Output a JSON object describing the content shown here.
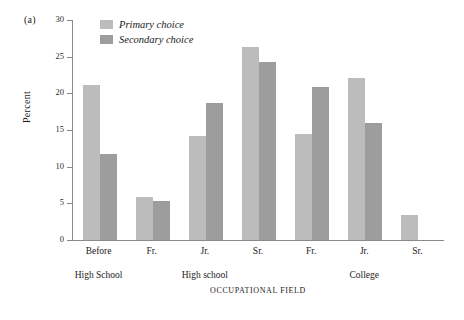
{
  "panel": {
    "label": "(a)"
  },
  "legend": {
    "position": "top-left-inside",
    "entries": [
      {
        "label": "Primary choice",
        "color": "#bcbcbc"
      },
      {
        "label": "Secondary choice",
        "color": "#9d9d9d"
      }
    ]
  },
  "axes": {
    "y_title": "Percent",
    "x_title": "OCCUPATIONAL FIELD",
    "y_ticks": [
      "0",
      "5",
      "10",
      "15",
      "20",
      "25",
      "30"
    ]
  },
  "group_labels": [
    {
      "text": "High School"
    },
    {
      "text": "High school"
    },
    {
      "text": "College"
    }
  ],
  "chart_data": {
    "type": "bar",
    "title": "",
    "subtitle": "",
    "xlabel": "OCCUPATIONAL FIELD",
    "ylabel": "Percent",
    "ylim": [
      0,
      30
    ],
    "yticks": [
      0,
      5,
      10,
      15,
      20,
      25,
      30
    ],
    "grid": false,
    "legend_position": "upper left (inside axes)",
    "categories": [
      "Before",
      "Fr.",
      "Jr.",
      "Sr.",
      "Fr.",
      "Jr.",
      "Sr."
    ],
    "category_groups": [
      "High School",
      "High school",
      "High school",
      "High school",
      "College",
      "College",
      "College"
    ],
    "series": [
      {
        "name": "Primary choice",
        "color": "#bcbcbc",
        "values": [
          21.1,
          5.9,
          14.2,
          26.3,
          14.4,
          22.1,
          3.4
        ]
      },
      {
        "name": "Secondary choice",
        "color": "#9d9d9d",
        "values": [
          11.7,
          5.3,
          18.7,
          24.3,
          20.9,
          16.0,
          null
        ]
      }
    ],
    "annotations": [
      "(a)"
    ]
  }
}
